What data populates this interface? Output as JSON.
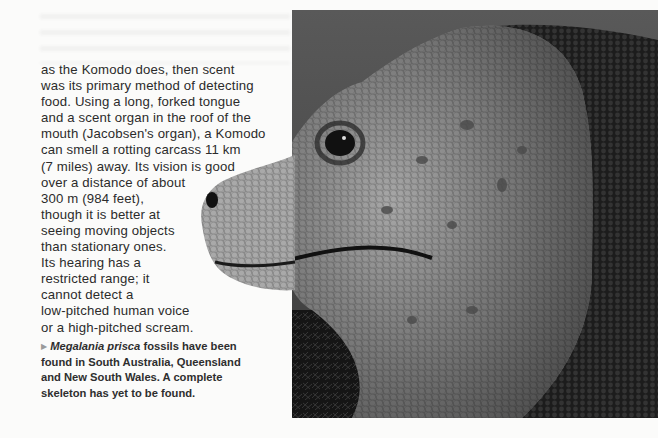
{
  "page": {
    "body_lines": [
      "as the Komodo does, then scent",
      "was its primary method of detecting",
      "food. Using a long, forked tongue",
      "and a scent organ in the roof of the",
      "mouth (Jacobsen's organ), a Komodo",
      "can smell a rotting carcass 11 km",
      "(7 miles) away. Its vision is good",
      "over a distance of about",
      "300 m (984 feet),",
      "though it is better at",
      "seeing moving objects",
      "than stationary ones.",
      "Its hearing has a",
      "restricted range; it",
      "cannot detect a",
      "low-pitched human voice",
      "or a high-pitched scream."
    ],
    "caption": {
      "bullet_icon": "triangle-right",
      "species": "Megalania prisca",
      "line1_rest": " fossils have been",
      "lines": [
        "found in South Australia, Queensland",
        "and New South Wales. A complete",
        "skeleton has yet to be found."
      ]
    },
    "photo": {
      "subject": "lizard head (Megalania reconstruction)",
      "style": "black-and-white photograph"
    }
  }
}
